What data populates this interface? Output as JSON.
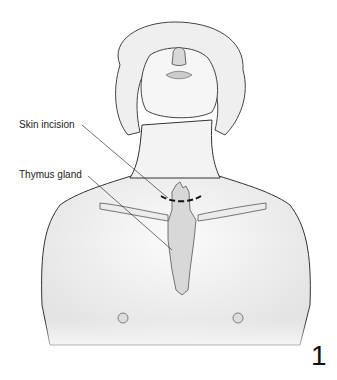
{
  "figure": {
    "number": "1",
    "labels": [
      {
        "id": "skin-incision",
        "text": "Skin incision"
      },
      {
        "id": "thymus-gland",
        "text": "Thymus gland"
      }
    ],
    "colors": {
      "background": "#ffffff",
      "skin": "#f2f2f2",
      "outline": "#333333",
      "incision": "#111111",
      "thymus": "#d6d6d6"
    }
  }
}
